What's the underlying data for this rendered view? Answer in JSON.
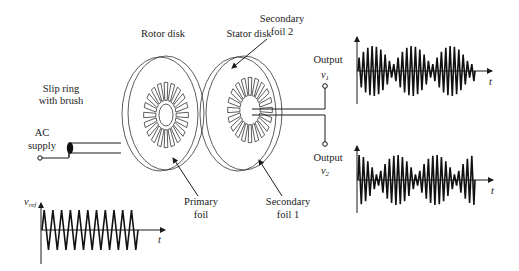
{
  "diagram": {
    "labels": {
      "rotor_disk": "Rotor disk",
      "stator_disk": "Stator disk",
      "secondary_foil_2": [
        "Secondary",
        "foil 2"
      ],
      "secondary_foil_1": [
        "Secondary",
        "foil 1"
      ],
      "primary_foil": [
        "Primary",
        "foil"
      ],
      "slip_ring": [
        "Slip ring",
        "with brush"
      ],
      "ac_supply": [
        "AC",
        "supply"
      ],
      "output_1": "Output",
      "output_1_symbol": "v",
      "output_1_sub": "1",
      "output_2": "Output",
      "output_2_symbol": "v",
      "output_2_sub": "2",
      "vref_symbol": "v",
      "vref_sub": "ref",
      "time_axis": "t"
    },
    "colors": {
      "line": "#1a1a1a",
      "background": "#ffffff"
    },
    "rotor": {
      "cx": 165,
      "cy": 113,
      "rx": 38,
      "ry": 57,
      "hub_rx": 7,
      "hub_ry": 11,
      "spokes": 20,
      "spoke_r_in": 14,
      "spoke_r_out": 31
    },
    "stator": {
      "cx": 244,
      "cy": 113,
      "rx": 38,
      "ry": 57,
      "spokes": 20,
      "spoke_r_in": 14,
      "spoke_r_out": 31
    }
  },
  "chart_data": [
    {
      "type": "line",
      "title": "Reference excitation",
      "ylabel": "v_ref",
      "xlabel": "t",
      "description": "Constant-amplitude triangular carrier",
      "cycles": 11,
      "amplitude": 1.0,
      "envelope": "constant"
    },
    {
      "type": "line",
      "title": "Output v1",
      "ylabel": "v1",
      "xlabel": "t",
      "description": "Amplitude-modulated carrier, envelope ~ |cos| shape with 3 lobes",
      "carrier_cycles": 27,
      "envelope_lobes": 3,
      "amplitude_max": 1.0,
      "amplitude_min": 0.2
    },
    {
      "type": "line",
      "title": "Output v2",
      "ylabel": "v2",
      "xlabel": "t",
      "description": "Amplitude-modulated carrier, envelope shifted 90 deg vs v1 (sin shape)",
      "carrier_cycles": 27,
      "envelope_lobes": 3,
      "amplitude_max": 1.0,
      "amplitude_min": 0.15
    }
  ]
}
